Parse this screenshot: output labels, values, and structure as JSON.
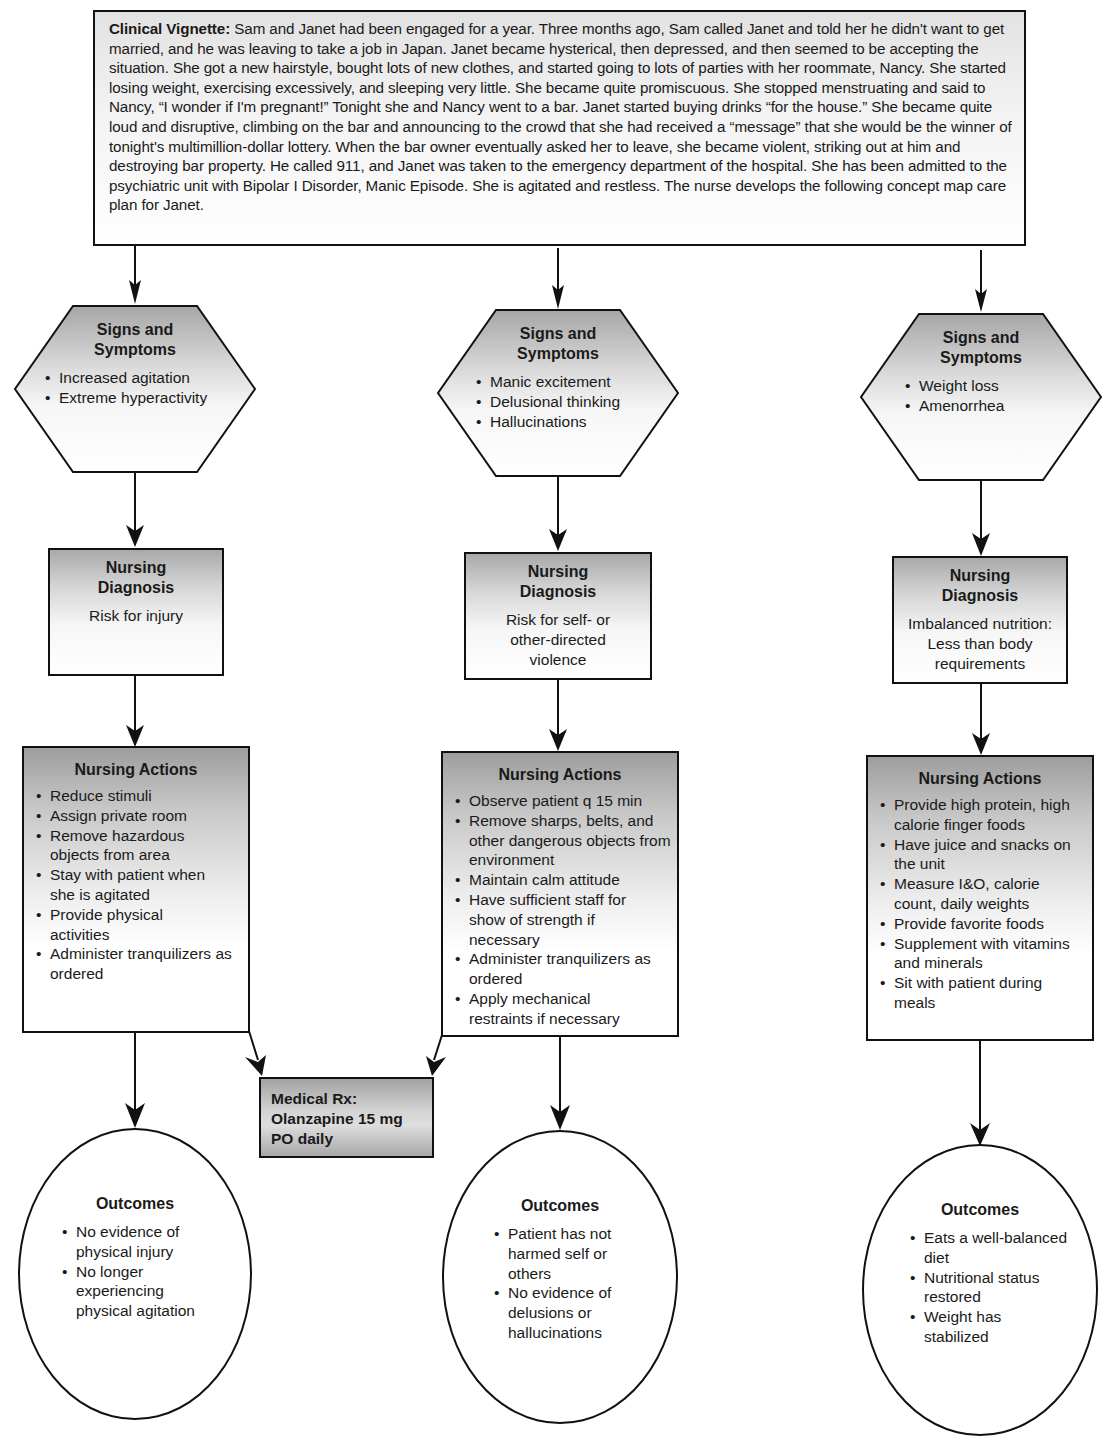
{
  "vignette": {
    "label": "Clinical Vignette:",
    "text": " Sam and Janet had been engaged for a year. Three months ago, Sam called Janet and told her he didn't want to get married, and he was leaving to take a job in Japan. Janet became hysterical, then depressed, and then seemed to be accepting the situation. She got a new hairstyle, bought lots of new clothes, and started going to lots of parties with her roommate, Nancy. She started losing weight, exercising excessively, and sleeping very little. She became quite promiscuous. She stopped menstruating and said to Nancy, “I wonder if I'm pregnant!” Tonight she and Nancy went to a bar. Janet started buying drinks “for the house.” She became quite loud and disruptive, climbing on the bar and announcing to the crowd that she had received a “message” that she would be the winner of tonight's multimillion-dollar lottery. When the bar owner eventually asked her to leave, she became violent, striking out at him and destroying bar property. He called 911, and Janet was taken to the emergency department of the hospital. She has been admitted to the psychiatric unit with Bipolar I Disorder, Manic Episode. She is agitated and restless. The nurse develops the following concept map care plan for Janet."
  },
  "columns": [
    {
      "signs": {
        "title": "Signs and Symptoms",
        "items": [
          "Increased agitation",
          "Extreme hyperactivity"
        ]
      },
      "diagnosis": {
        "title": "Nursing Diagnosis",
        "text": "Risk for injury"
      },
      "actions": {
        "title": "Nursing Actions",
        "items": [
          "Reduce stimuli",
          "Assign private room",
          "Remove hazardous objects from area",
          "Stay with patient when she is agitated",
          "Provide physical activities",
          "Administer tranquilizers as ordered"
        ]
      },
      "outcomes": {
        "title": "Outcomes",
        "items": [
          "No evidence of physical injury",
          "No longer experiencing physical agitation"
        ]
      }
    },
    {
      "signs": {
        "title": "Signs and Symptoms",
        "items": [
          "Manic excitement",
          "Delusional thinking",
          "Hallucinations"
        ]
      },
      "diagnosis": {
        "title": "Nursing Diagnosis",
        "text": "Risk for self- or other-directed violence"
      },
      "actions": {
        "title": "Nursing Actions",
        "items": [
          "Observe patient q 15 min",
          "Remove sharps, belts, and other dangerous objects from environment",
          "Maintain calm attitude",
          "Have sufficient staff for show of strength if necessary",
          "Administer tranquilizers as ordered",
          "Apply mechanical restraints if necessary"
        ]
      },
      "outcomes": {
        "title": "Outcomes",
        "items": [
          "Patient has not harmed self or others",
          "No evidence of delusions or hallucinations"
        ]
      }
    },
    {
      "signs": {
        "title": "Signs and Symptoms",
        "items": [
          "Weight loss",
          "Amenorrhea"
        ]
      },
      "diagnosis": {
        "title": "Nursing Diagnosis",
        "text": "Imbalanced nutrition: Less than body requirements"
      },
      "actions": {
        "title": "Nursing Actions",
        "items": [
          "Provide high protein, high calorie finger foods",
          "Have juice and snacks on the unit",
          "Measure I&O, calorie count, daily weights",
          "Provide favorite foods",
          "Supplement with vitamins and minerals",
          "Sit with patient during meals"
        ]
      },
      "outcomes": {
        "title": "Outcomes",
        "items": [
          "Eats a well-balanced diet",
          "Nutritional status restored",
          "Weight has stabilized"
        ]
      }
    }
  ],
  "medical_rx": {
    "line1": "Medical Rx:",
    "line2": "Olanzapine 15 mg",
    "line3": "PO daily"
  }
}
